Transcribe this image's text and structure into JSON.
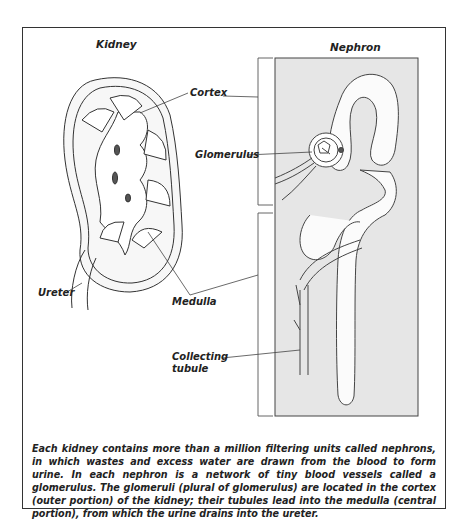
{
  "diagram": {
    "kidney_title": "Kidney",
    "nephron_title": "Nephron",
    "labels": {
      "cortex": "Cortex",
      "glomerulus": "Glomerulus",
      "ureter": "Ureter",
      "medulla": "Medulla",
      "collecting_tubule_line1": "Collecting",
      "collecting_tubule_line2": "tubule"
    },
    "caption": "Each kidney contains more than a million filtering units called nephrons, in which wastes and excess water are drawn from the blood to form urine. In each nephron is a network of tiny blood vessels called a glomerulus. The glomeruli (plural of glomerulus) are located in the cortex (outer portion) of the kidney; their tubules lead into the medulla (central portion), from which the urine drains into the ureter.",
    "colors": {
      "line": "#333333",
      "nephron_panel": "#e6e6e6",
      "background": "#ffffff"
    }
  }
}
